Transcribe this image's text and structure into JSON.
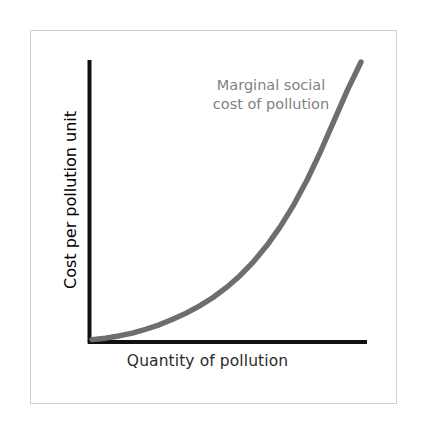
{
  "figure": {
    "background_color": "#ffffff",
    "frame_color": "#cfcfcf",
    "axis_color": "#101010",
    "curve_color": "#6e6e6e",
    "annotation_color": "#828282",
    "axis_label_color": "#2b2b2b"
  },
  "axes": {
    "x_title": "Quantity of pollution",
    "y_title": "Cost per pollution unit"
  },
  "annotation": {
    "line1": "Marginal social",
    "line2": "cost of pollution"
  },
  "chart_data": {
    "type": "line",
    "title": "",
    "subtitle": "",
    "xlabel": "Quantity of pollution",
    "ylabel": "Cost per pollution unit",
    "xlim": [
      0,
      1
    ],
    "ylim": [
      0,
      1
    ],
    "grid": false,
    "legend_position": "none",
    "axis_ticks": {
      "x_tick_labels": [],
      "y_tick_labels": []
    },
    "annotations": [
      {
        "text": "Marginal social cost of pollution",
        "x": 0.62,
        "y": 0.88
      }
    ],
    "series": [
      {
        "name": "Marginal social cost of pollution",
        "color": "#6e6e6e",
        "line_width": 5,
        "shape": "convex-increasing",
        "x": [
          0.0,
          0.05,
          0.1,
          0.15,
          0.2,
          0.25,
          0.3,
          0.35,
          0.4,
          0.45,
          0.5,
          0.55,
          0.6,
          0.65,
          0.7,
          0.75,
          0.8,
          0.85,
          0.9,
          0.95,
          1.0
        ],
        "y": [
          0.005,
          0.01,
          0.018,
          0.028,
          0.042,
          0.058,
          0.078,
          0.1,
          0.126,
          0.156,
          0.192,
          0.234,
          0.284,
          0.342,
          0.41,
          0.488,
          0.578,
          0.68,
          0.79,
          0.9,
          1.0
        ]
      }
    ]
  }
}
